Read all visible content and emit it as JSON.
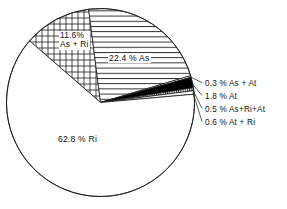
{
  "chart_data": {
    "type": "pie",
    "title": "",
    "subtitle": "",
    "xlabel": "",
    "ylabel": "",
    "legend_position": "none",
    "grid": false,
    "unit": "%",
    "categories": [
      "As + Ri",
      "As",
      "As + At",
      "At",
      "As+Ri+At",
      "At + Ri",
      "Ri"
    ],
    "values": [
      11.6,
      22.4,
      0.3,
      1.8,
      0.5,
      0.6,
      62.8
    ],
    "slices": [
      {
        "key": "asri",
        "label": "11.6% As+Ri",
        "value_text": "11.6%",
        "name_text": "As + Ri",
        "value": 11.6,
        "fill": "crosshatch",
        "label_placement": "inside"
      },
      {
        "key": "as",
        "label": "22.4 % As",
        "value_text": "22.4",
        "name_text": "As",
        "value": 22.4,
        "fill": "horizontal-lines",
        "label_placement": "inside"
      },
      {
        "key": "asat",
        "label": "0.3 % As + At",
        "value_text": "0.3",
        "name_text": "As + At",
        "value": 0.3,
        "fill": "white",
        "label_placement": "leader-right"
      },
      {
        "key": "at",
        "label": "1.8 % At",
        "value_text": "1.8",
        "name_text": "At",
        "value": 1.8,
        "fill": "solid-black",
        "label_placement": "leader-right"
      },
      {
        "key": "asriat",
        "label": "0.5 % As+Ri+At",
        "value_text": "0.5",
        "name_text": "As+Ri+At",
        "value": 0.5,
        "fill": "vertical-lines",
        "label_placement": "leader-right"
      },
      {
        "key": "atri",
        "label": "0.6 % At + Ri",
        "value_text": "0.6",
        "name_text": "At + Ri",
        "value": 0.6,
        "fill": "white",
        "label_placement": "leader-right"
      },
      {
        "key": "ri",
        "label": "62.8 % Ri",
        "value_text": "62.8",
        "name_text": "Ri",
        "value": 62.8,
        "fill": "white",
        "label_placement": "inside"
      }
    ],
    "colors": {
      "stroke": "#1a1a1a",
      "background": "#ffffff",
      "solid_slice": "#000000",
      "text": "#111111"
    }
  },
  "labels": {
    "asri_value": "11.6%",
    "asri_name": "As + Ri",
    "as": "22.4 % As",
    "ri": "62.8 % Ri",
    "asat": "0.3 % As + At",
    "at": "1.8 % At",
    "asriat": "0.5 % As+Ri+At",
    "atri": "0.6 % At + Ri"
  }
}
